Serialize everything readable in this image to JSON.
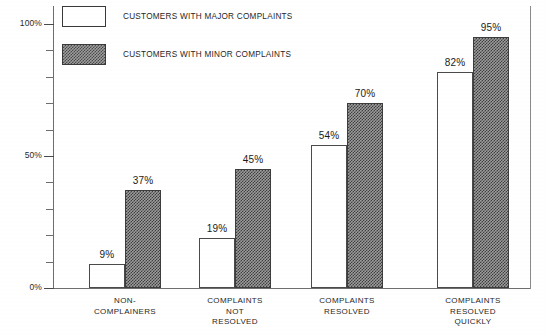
{
  "chart_data": {
    "type": "bar",
    "title": "",
    "xlabel": "",
    "ylabel": "",
    "ylim": [
      0,
      100
    ],
    "grid": false,
    "legend_position": "top-left-inside",
    "y_ticks": [
      {
        "value": 100,
        "label": "100%",
        "major": true
      },
      {
        "value": 90,
        "label": "",
        "major": false
      },
      {
        "value": 80,
        "label": "",
        "major": false
      },
      {
        "value": 70,
        "label": "",
        "major": false
      },
      {
        "value": 60,
        "label": "",
        "major": false
      },
      {
        "value": 50,
        "label": "50%",
        "major": true
      },
      {
        "value": 40,
        "label": "",
        "major": false
      },
      {
        "value": 30,
        "label": "",
        "major": false
      },
      {
        "value": 20,
        "label": "",
        "major": false
      },
      {
        "value": 10,
        "label": "",
        "major": false
      },
      {
        "value": 0,
        "label": "0%",
        "major": true
      }
    ],
    "categories": [
      "NON-\nCOMPLAINERS",
      "COMPLAINTS\nNOT\nRESOLVED",
      "COMPLAINTS\nRESOLVED",
      "COMPLAINTS\nRESOLVED\nQUICKLY"
    ],
    "series": [
      {
        "name": "CUSTOMERS WITH MAJOR COMPLAINTS",
        "style": "white-fill",
        "color": "#ffffff",
        "values": [
          9,
          19,
          54,
          82
        ],
        "value_labels": [
          "9%",
          "19%",
          "54%",
          "82%"
        ]
      },
      {
        "name": "CUSTOMERS WITH MINOR COMPLAINTS",
        "style": "checker-hatch",
        "color": "#4a4a4a",
        "values": [
          37,
          45,
          70,
          95
        ],
        "value_labels": [
          "37%",
          "45%",
          "70%",
          "95%"
        ]
      }
    ]
  },
  "legend": {
    "items": [
      {
        "label": "CUSTOMERS WITH MAJOR COMPLAINTS"
      },
      {
        "label": "CUSTOMERS WITH MINOR COMPLAINTS"
      }
    ]
  },
  "axis": {
    "y_top_label": "100%",
    "y_mid_label": "50%",
    "y_bottom_label": "0%"
  },
  "bars": [
    {
      "group": 0,
      "series": 0,
      "value": 9,
      "label": "9%"
    },
    {
      "group": 0,
      "series": 1,
      "value": 37,
      "label": "37%"
    },
    {
      "group": 1,
      "series": 0,
      "value": 19,
      "label": "19%"
    },
    {
      "group": 1,
      "series": 1,
      "value": 45,
      "label": "45%"
    },
    {
      "group": 2,
      "series": 0,
      "value": 54,
      "label": "54%"
    },
    {
      "group": 2,
      "series": 1,
      "value": 70,
      "label": "70%"
    },
    {
      "group": 3,
      "series": 0,
      "value": 82,
      "label": "82%"
    },
    {
      "group": 3,
      "series": 1,
      "value": 95,
      "label": "95%"
    }
  ],
  "categories_display": [
    "NON-\nCOMPLAINERS",
    "COMPLAINTS\nNOT\nRESOLVED",
    "COMPLAINTS\nRESOLVED",
    "COMPLAINTS\nRESOLVED\nQUICKLY"
  ]
}
